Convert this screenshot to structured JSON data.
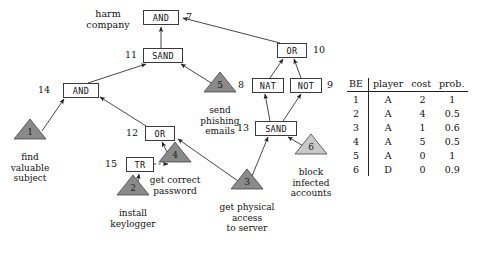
{
  "diagram": {
    "title_label": "harm company",
    "gates": [
      {
        "id": "7",
        "type": "AND",
        "x": 143,
        "y": 10,
        "w": 36,
        "idx": 186,
        "idy": 11
      },
      {
        "id": "11",
        "type": "SAND",
        "x": 143,
        "y": 48,
        "w": 40,
        "idx": 125,
        "idy": 49
      },
      {
        "id": "14",
        "type": "AND",
        "x": 63,
        "y": 83,
        "w": 36,
        "idx": 38,
        "idy": 84
      },
      {
        "id": "12",
        "type": "OR",
        "x": 145,
        "y": 126,
        "w": 30,
        "idx": 126,
        "idy": 127
      },
      {
        "id": "15",
        "type": "TR",
        "x": 126,
        "y": 157,
        "w": 28,
        "idx": 105,
        "idy": 158
      },
      {
        "id": "10",
        "type": "OR",
        "x": 277,
        "y": 43,
        "w": 30,
        "idx": 313,
        "idy": 44
      },
      {
        "id": "8",
        "type": "NAT",
        "x": 252,
        "y": 78,
        "w": 32,
        "idx": 238,
        "idy": 79
      },
      {
        "id": "9",
        "type": "NOT",
        "x": 290,
        "y": 78,
        "w": 32,
        "idx": 327,
        "idy": 79
      },
      {
        "id": "13",
        "type": "SAND",
        "x": 255,
        "y": 121,
        "w": 42,
        "idx": 237,
        "idy": 122
      }
    ],
    "leaves": [
      {
        "num": "1",
        "label": "find\nvaluable\nsubject",
        "cx": 30,
        "cy": 140,
        "fill": "#8a8a8a",
        "lx": 30,
        "ly": 152
      },
      {
        "num": "2",
        "label": "install\nkeylogger",
        "cx": 133,
        "cy": 196,
        "fill": "#8a8a8a",
        "lx": 133,
        "ly": 208
      },
      {
        "num": "4",
        "label": "get correct\npassword",
        "cx": 175,
        "cy": 163,
        "fill": "#8a8a8a",
        "lx": 175,
        "ly": 175
      },
      {
        "num": "5",
        "label": "send\nphishing\nemails",
        "cx": 220,
        "cy": 93,
        "fill": "#8a8a8a",
        "lx": 220,
        "ly": 105
      },
      {
        "num": "3",
        "label": "get physical\naccess\nto server",
        "cx": 247,
        "cy": 190,
        "fill": "#8a8a8a",
        "lx": 247,
        "ly": 202
      },
      {
        "num": "6",
        "label": "block\ninfected\naccounts",
        "cx": 311,
        "cy": 155,
        "fill": "#c9c9c9",
        "lx": 311,
        "ly": 167
      }
    ]
  },
  "table": {
    "headers": [
      "BE",
      "player",
      "cost",
      "prob."
    ],
    "rows": [
      [
        "1",
        "A",
        "2",
        "1"
      ],
      [
        "2",
        "A",
        "4",
        "0.5"
      ],
      [
        "3",
        "A",
        "1",
        "0.6"
      ],
      [
        "4",
        "A",
        "5",
        "0.5"
      ],
      [
        "5",
        "A",
        "0",
        "1"
      ],
      [
        "6",
        "D",
        "0",
        "0.9"
      ]
    ]
  }
}
